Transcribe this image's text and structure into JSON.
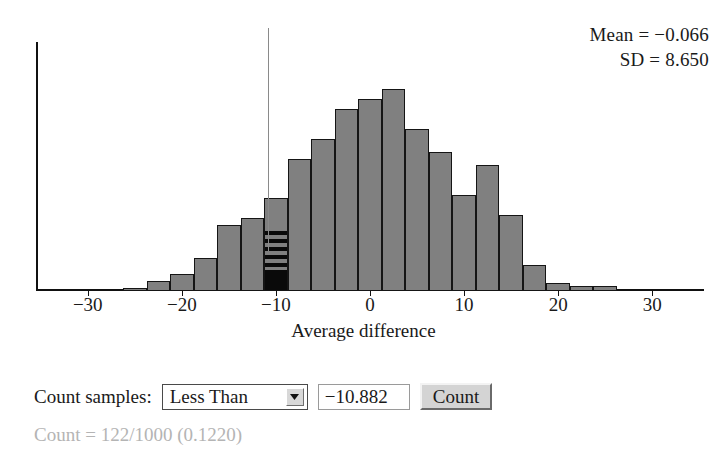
{
  "statistics": {
    "mean_label": "Mean = −0.066",
    "sd_label": "SD = 8.650"
  },
  "controls": {
    "count_samples_label": "Count samples:",
    "operator_value": "Less Than",
    "operator_arrow_icon": "chevron-down-icon",
    "threshold_value": "−10.882",
    "count_button_label": "Count",
    "result_text": "Count = 122/1000 (0.1220)"
  },
  "chart_data": {
    "type": "bar",
    "title": "",
    "xlabel": "Average difference",
    "ylabel": "",
    "xlim": [
      -35.5,
      35.5
    ],
    "ylim": [
      0,
      125
    ],
    "grid": false,
    "legend": null,
    "bin_width": 2.5,
    "tick_labels": [
      "−30",
      "−20",
      "−10",
      "0",
      "10",
      "20",
      "30"
    ],
    "ticks": [
      -30,
      -20,
      -10,
      0,
      10,
      20,
      30
    ],
    "cutoff": {
      "value": -10.882,
      "operator": "Less Than",
      "counted": 122,
      "total": 1000,
      "proportion": 0.122,
      "color": "#8a8a8a"
    },
    "bar_color": "#808080",
    "bar_edge_color": "#151515",
    "highlight_color": "#0a0a0a",
    "bin_centers": [
      -25.0,
      -22.5,
      -20.0,
      -17.5,
      -15.0,
      -12.5,
      -10.0,
      -7.5,
      -5.0,
      -2.5,
      0.0,
      2.5,
      5.0,
      7.5,
      10.0,
      12.5,
      15.0,
      17.5,
      20.0,
      22.5,
      25.0
    ],
    "values": [
      2,
      6,
      10,
      20,
      40,
      44,
      56,
      80,
      92,
      110,
      116,
      122,
      98,
      84,
      58,
      76,
      46,
      16,
      5,
      3,
      3
    ]
  }
}
